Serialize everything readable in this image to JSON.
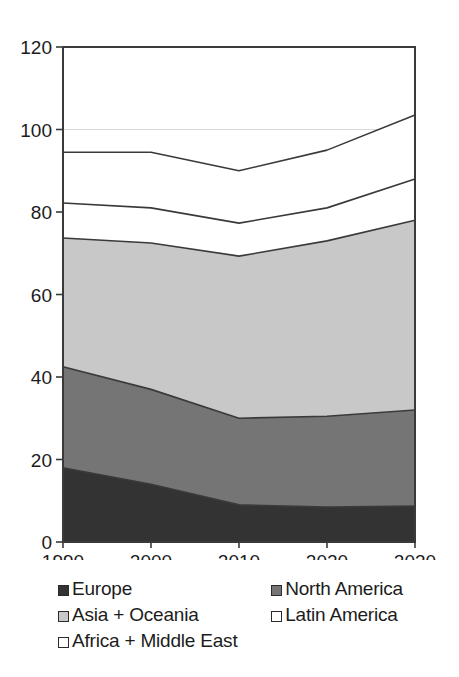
{
  "chart_data": {
    "type": "area",
    "stacked": true,
    "title": "",
    "subtitle": "",
    "xlabel": "",
    "ylabel": "",
    "x": [
      1990,
      2000,
      2010,
      2020,
      2030
    ],
    "xtick_labels": [
      "1990",
      "2000",
      "2010",
      "2020",
      "2030"
    ],
    "ytick_labels": [
      "0",
      "20",
      "40",
      "60",
      "80",
      "100",
      "120"
    ],
    "yticks": [
      0,
      20,
      40,
      60,
      80,
      100,
      120
    ],
    "ylim": [
      0,
      120
    ],
    "xlim": [
      1990,
      2030
    ],
    "grid": "horizontal-faint-at-100",
    "legend_position": "below-plot",
    "series": [
      {
        "name": "Europe",
        "color": "#333333",
        "values": [
          18.0,
          14.0,
          9.0,
          8.5,
          8.7
        ]
      },
      {
        "name": "North America",
        "color": "#757575",
        "values": [
          24.5,
          23.0,
          21.0,
          22.0,
          23.3
        ]
      },
      {
        "name": "Asia + Oceania",
        "color": "#c8c8c8",
        "values": [
          31.2,
          35.5,
          39.3,
          42.5,
          46.0
        ]
      },
      {
        "name": "Latin America",
        "color": "#ffffff",
        "values": [
          8.5,
          8.5,
          8.0,
          8.0,
          10.0
        ]
      },
      {
        "name": "Africa + Middle East",
        "color": "#ffffff",
        "values": [
          12.3,
          13.5,
          12.7,
          14.0,
          15.5
        ]
      }
    ],
    "cumulative_tops": [
      [
        18.0,
        14.0,
        9.0,
        8.5,
        8.7
      ],
      [
        42.5,
        37.0,
        30.0,
        30.5,
        32.0
      ],
      [
        73.7,
        72.5,
        69.3,
        73.0,
        78.0
      ],
      [
        82.2,
        81.0,
        77.3,
        81.0,
        88.0
      ],
      [
        94.5,
        94.5,
        90.0,
        95.0,
        103.5
      ]
    ]
  },
  "legend": {
    "rows": [
      [
        {
          "label": "Europe",
          "swatch": "#333333",
          "name": "legend-swatch-europe"
        },
        {
          "label": "North America",
          "swatch": "#757575",
          "name": "legend-swatch-north-america"
        }
      ],
      [
        {
          "label": "Asia + Oceania",
          "swatch": "#c8c8c8",
          "name": "legend-swatch-asia-oceania"
        },
        {
          "label": "Latin America",
          "swatch": "#ffffff",
          "name": "legend-swatch-latin-america"
        }
      ],
      [
        {
          "label": "Africa + Middle East",
          "swatch": "#ffffff",
          "name": "legend-swatch-africa-middle-east"
        }
      ]
    ]
  },
  "axis": {
    "frame_color": "#3a3a3a",
    "gridline_color": "#d8d8d8",
    "series_line_color": "#3a3a3a"
  }
}
